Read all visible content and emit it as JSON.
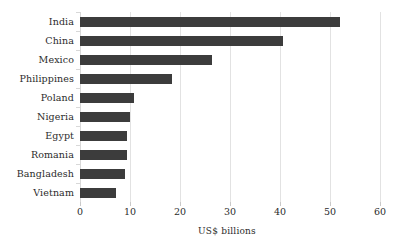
{
  "chart_data": {
    "type": "bar",
    "orientation": "horizontal",
    "title": "",
    "subtitle": "",
    "xlabel": "US$ billions",
    "ylabel": "",
    "xlim": [
      0,
      60
    ],
    "xticks": [
      0,
      10,
      20,
      30,
      40,
      50,
      60
    ],
    "xtick_labels": [
      "0",
      "10",
      "20",
      "30",
      "40",
      "50",
      "60"
    ],
    "grid": true,
    "grid_axis": "x",
    "legend": false,
    "legend_position": "none",
    "bar_color": "#3c3c3c",
    "background_color": "#ffffff",
    "gridline_color": "#e2e2e2",
    "text_color": "#2b2b2b",
    "categories": [
      "India",
      "China",
      "Mexico",
      "Philippines",
      "Poland",
      "Nigeria",
      "Egypt",
      "Romania",
      "Bangladesh",
      "Vietnam"
    ],
    "values": [
      52.0,
      40.6,
      26.3,
      18.4,
      10.7,
      9.9,
      9.4,
      9.3,
      8.9,
      7.2
    ]
  }
}
